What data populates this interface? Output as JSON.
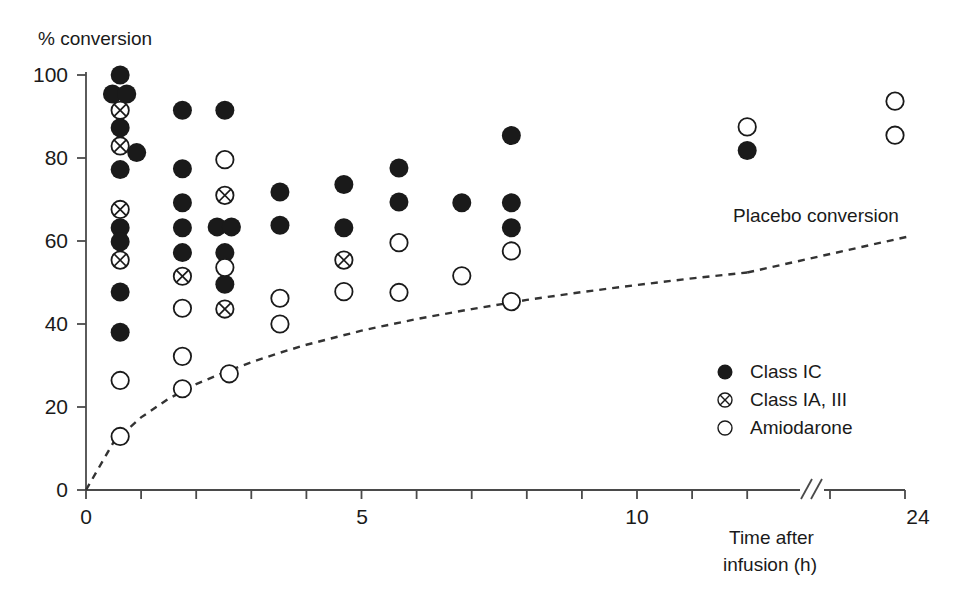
{
  "chart_data": {
    "type": "scatter",
    "title": "",
    "xlabel": "Time after infusion (h)",
    "ylabel": "% conversion",
    "xlim": [
      0,
      24
    ],
    "ylim": [
      0,
      100
    ],
    "grid": false,
    "axis_break": {
      "label": "//",
      "at_x": 13.2,
      "note": "axis break between 12 and 24 h"
    },
    "legend_position": "right-middle",
    "x_ticks": [
      0,
      1,
      2,
      3,
      4,
      5,
      6,
      7,
      8,
      9,
      10,
      11,
      12,
      24
    ],
    "x_tick_labels": [
      "0",
      "",
      "",
      "",
      "",
      "5",
      "",
      "",
      "",
      "",
      "10",
      "",
      "",
      "24"
    ],
    "y_ticks": [
      0,
      20,
      40,
      60,
      80,
      100
    ],
    "y_tick_labels": [
      "0",
      "20",
      "40",
      "60",
      "80",
      "100"
    ],
    "annotations": [
      {
        "text": "Placebo conversion",
        "x": 17.3,
        "y": 67.0
      }
    ],
    "series": [
      {
        "name": "Class IC",
        "marker": "filled-circle",
        "color": "#1a1a1a",
        "points": [
          {
            "x": 0.62,
            "y": 100.0
          },
          {
            "x": 0.48,
            "y": 95.4
          },
          {
            "x": 0.74,
            "y": 95.4
          },
          {
            "x": 0.62,
            "y": 87.3
          },
          {
            "x": 0.92,
            "y": 81.3
          },
          {
            "x": 0.62,
            "y": 77.2
          },
          {
            "x": 0.62,
            "y": 63.2
          },
          {
            "x": 0.62,
            "y": 59.8
          },
          {
            "x": 0.62,
            "y": 47.7
          },
          {
            "x": 0.62,
            "y": 38.0
          },
          {
            "x": 1.75,
            "y": 91.5
          },
          {
            "x": 1.75,
            "y": 77.4
          },
          {
            "x": 1.75,
            "y": 69.2
          },
          {
            "x": 1.75,
            "y": 63.2
          },
          {
            "x": 1.75,
            "y": 57.2
          },
          {
            "x": 2.52,
            "y": 91.5
          },
          {
            "x": 2.38,
            "y": 63.4
          },
          {
            "x": 2.64,
            "y": 63.4
          },
          {
            "x": 2.52,
            "y": 57.2
          },
          {
            "x": 2.52,
            "y": 49.6
          },
          {
            "x": 3.52,
            "y": 71.8
          },
          {
            "x": 3.52,
            "y": 63.8
          },
          {
            "x": 4.68,
            "y": 73.6
          },
          {
            "x": 4.68,
            "y": 63.2
          },
          {
            "x": 5.68,
            "y": 77.6
          },
          {
            "x": 5.68,
            "y": 69.4
          },
          {
            "x": 6.82,
            "y": 69.2
          },
          {
            "x": 7.72,
            "y": 85.4
          },
          {
            "x": 7.72,
            "y": 69.2
          },
          {
            "x": 7.72,
            "y": 63.2
          },
          {
            "x": 12.0,
            "y": 81.8
          }
        ]
      },
      {
        "name": "Class IA, III",
        "marker": "crossed-circle",
        "color": "#1a1a1a",
        "points": [
          {
            "x": 0.62,
            "y": 91.5
          },
          {
            "x": 0.62,
            "y": 82.9
          },
          {
            "x": 0.62,
            "y": 67.6
          },
          {
            "x": 0.62,
            "y": 55.4
          },
          {
            "x": 1.75,
            "y": 51.5
          },
          {
            "x": 2.52,
            "y": 71.0
          },
          {
            "x": 2.52,
            "y": 43.6
          },
          {
            "x": 4.68,
            "y": 55.4
          }
        ]
      },
      {
        "name": "Amiodarone",
        "marker": "open-circle",
        "color": "#1a1a1a",
        "points": [
          {
            "x": 0.62,
            "y": 26.4
          },
          {
            "x": 0.62,
            "y": 12.9
          },
          {
            "x": 1.75,
            "y": 43.8
          },
          {
            "x": 1.75,
            "y": 32.2
          },
          {
            "x": 1.75,
            "y": 24.4
          },
          {
            "x": 2.52,
            "y": 79.6
          },
          {
            "x": 2.52,
            "y": 53.6
          },
          {
            "x": 2.6,
            "y": 28.0
          },
          {
            "x": 3.52,
            "y": 46.2
          },
          {
            "x": 3.52,
            "y": 40.0
          },
          {
            "x": 4.68,
            "y": 47.8
          },
          {
            "x": 5.68,
            "y": 59.6
          },
          {
            "x": 5.68,
            "y": 47.6
          },
          {
            "x": 6.82,
            "y": 51.6
          },
          {
            "x": 7.72,
            "y": 57.6
          },
          {
            "x": 7.72,
            "y": 45.4
          },
          {
            "x": 12.0,
            "y": 87.5
          },
          {
            "x": 24.0,
            "y": 93.7
          },
          {
            "x": 24.0,
            "y": 85.5
          }
        ]
      }
    ],
    "placebo_curve": {
      "name": "Placebo conversion",
      "style": "dashed",
      "color": "#333333",
      "points": [
        {
          "x": 0.0,
          "y": 0.0
        },
        {
          "x": 0.5,
          "y": 11.5
        },
        {
          "x": 1.0,
          "y": 17.5
        },
        {
          "x": 1.5,
          "y": 22.0
        },
        {
          "x": 2.0,
          "y": 25.5
        },
        {
          "x": 2.5,
          "y": 28.3
        },
        {
          "x": 3.0,
          "y": 30.8
        },
        {
          "x": 3.5,
          "y": 33.0
        },
        {
          "x": 4.0,
          "y": 35.0
        },
        {
          "x": 5.0,
          "y": 38.4
        },
        {
          "x": 6.0,
          "y": 41.2
        },
        {
          "x": 7.0,
          "y": 43.6
        },
        {
          "x": 8.0,
          "y": 45.8
        },
        {
          "x": 9.0,
          "y": 47.7
        },
        {
          "x": 10.0,
          "y": 49.4
        },
        {
          "x": 11.0,
          "y": 51.0
        },
        {
          "x": 12.0,
          "y": 52.4
        },
        {
          "x": 24.0,
          "y": 61.0
        }
      ]
    }
  },
  "axes": {
    "y_title": "% conversion",
    "x_title_line1": "Time after",
    "x_title_line2": "infusion (h)",
    "y_labels": [
      "100",
      "80",
      "60",
      "40",
      "20",
      "0"
    ],
    "x_labels": [
      "0",
      "5",
      "10",
      "24"
    ],
    "break_glyph": "//"
  },
  "legend": {
    "items": [
      {
        "label": "Class IC",
        "marker": "filled-circle"
      },
      {
        "label": "Class IA, III",
        "marker": "crossed-circle"
      },
      {
        "label": "Amiodarone",
        "marker": "open-circle"
      }
    ]
  },
  "annotation": {
    "placebo": "Placebo conversion"
  },
  "colors": {
    "ink": "#1a1a1a",
    "axis": "#4a4a4a",
    "dash": "#333333",
    "background": "#ffffff"
  }
}
